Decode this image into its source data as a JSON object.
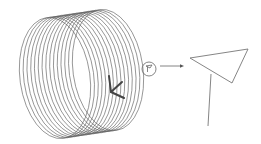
{
  "diagram": {
    "colors": {
      "background": "#ffffff",
      "coil_stroke": "#5a5a5a",
      "mark_stroke": "#444444",
      "flag_stroke": "#777777"
    },
    "coil": {
      "ellipse_count": 15,
      "first_center": [
        55,
        78
      ],
      "last_center": [
        108,
        70
      ],
      "rx": 35,
      "ry": 61
    },
    "v_mark": {
      "points": [
        [
          109,
          76
        ],
        [
          111,
          92
        ],
        [
          122,
          82
        ]
      ],
      "tail": [
        [
          111,
          92
        ],
        [
          124,
          98
        ]
      ]
    },
    "callout_circle": {
      "cx": 149,
      "cy": 69,
      "r": 7
    },
    "arrow": {
      "from": [
        160,
        66
      ],
      "to": [
        184,
        66
      ]
    },
    "flag": {
      "triangle": [
        [
          190,
          58
        ],
        [
          248,
          49
        ],
        [
          232,
          83
        ]
      ],
      "pole": [
        [
          211,
          74
        ],
        [
          208,
          126
        ]
      ]
    },
    "labels": []
  }
}
